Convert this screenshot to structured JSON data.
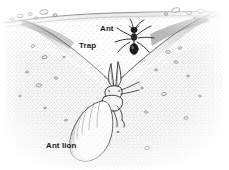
{
  "figure": {
    "medium": "pen-and-ink stipple illustration",
    "palette": {
      "ink": "#1a1a1a",
      "sand_dark": "#8a8a8a",
      "sand_mid": "#b5b5b5",
      "sand_light": "#dcdcdc",
      "background": "#ffffff"
    },
    "labels": [
      {
        "id": "ant",
        "text": "Ant",
        "x": 100,
        "y": 24
      },
      {
        "id": "trap",
        "text": "Trap",
        "x": 79,
        "y": 41
      },
      {
        "id": "antlion",
        "text": "Ant lion",
        "x": 46,
        "y": 141
      }
    ],
    "subjects": {
      "ant": {
        "name": "Ant",
        "position": "sliding down the right inner slope of the pit",
        "parts": [
          "head",
          "antennae",
          "thorax",
          "abdomen",
          "six legs"
        ]
      },
      "antlion": {
        "name": "Ant lion",
        "position": "buried in sand beneath the funnel throat",
        "parts": [
          "segmented abdomen",
          "thorax",
          "head",
          "paired sickle mandibles"
        ]
      },
      "trap": {
        "name": "Trap",
        "shape": "conical funnel pit dug in loose sand",
        "ground_line": "top surface with scattered pebbles along the rim"
      }
    },
    "ground": {
      "surface_label": "sand surface",
      "pebble_count_left": 6,
      "pebble_count_right": 7
    }
  }
}
